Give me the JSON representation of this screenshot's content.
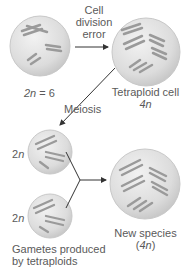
{
  "diagram": {
    "labels": {
      "arrow1_line1": "Cell",
      "arrow1_line2": "division",
      "arrow1_line3": "error",
      "parent_cell": "2n = 6",
      "tetraploid_line1": "Tetraploid cell",
      "tetraploid_line2": "4n",
      "meiosis": "Meiosis",
      "gamete1": "2n",
      "gamete2": "2n",
      "gametes_line1": "Gametes produced",
      "gametes_line2": "by tetraploids",
      "new_species_line1": "New species",
      "new_species_line2": "(4n)"
    },
    "colors": {
      "cell_fill": "#d9d9d9",
      "cell_edge": "#bdbdbd",
      "chromosome": "#9a9a9a",
      "arrow": "#333333",
      "text": "#5a5a5a"
    }
  }
}
